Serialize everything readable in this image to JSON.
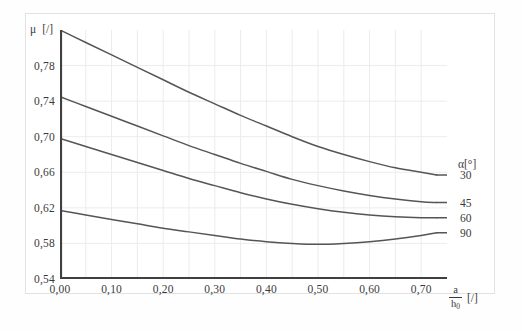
{
  "chart_data": {
    "type": "line",
    "title": "",
    "xlabel": "a/h0 [/]",
    "ylabel": "μ [/]",
    "xlim": [
      0.0,
      0.75
    ],
    "ylim": [
      0.54,
      0.82
    ],
    "grid": true,
    "legend_position": "right",
    "legend_title": "α[°]",
    "x_ticks": [
      0.0,
      0.1,
      0.2,
      0.3,
      0.4,
      0.5,
      0.6,
      0.7
    ],
    "x_tick_labels": [
      "0,00",
      "0,10",
      "0,20",
      "0,30",
      "0,40",
      "0,50",
      "0,60",
      "0,70"
    ],
    "y_ticks": [
      0.54,
      0.58,
      0.62,
      0.66,
      0.7,
      0.74,
      0.78
    ],
    "y_tick_labels": [
      "0,54",
      "0,58",
      "0,62",
      "0,66",
      "0,70",
      "0,74",
      "0,78"
    ],
    "x": [
      0.0,
      0.05,
      0.1,
      0.15,
      0.2,
      0.25,
      0.3,
      0.35,
      0.4,
      0.45,
      0.5,
      0.55,
      0.6,
      0.65,
      0.7,
      0.73
    ],
    "series": [
      {
        "name": "30",
        "label": "30",
        "color": "#555555",
        "values": [
          0.82,
          0.806,
          0.792,
          0.778,
          0.764,
          0.75,
          0.737,
          0.724,
          0.712,
          0.7,
          0.689,
          0.68,
          0.672,
          0.665,
          0.66,
          0.657
        ]
      },
      {
        "name": "45",
        "label": "45",
        "color": "#555555",
        "values": [
          0.745,
          0.734,
          0.723,
          0.712,
          0.701,
          0.69,
          0.68,
          0.67,
          0.661,
          0.652,
          0.645,
          0.639,
          0.634,
          0.63,
          0.627,
          0.626
        ]
      },
      {
        "name": "60",
        "label": "60",
        "color": "#555555",
        "values": [
          0.698,
          0.689,
          0.68,
          0.671,
          0.662,
          0.653,
          0.645,
          0.637,
          0.63,
          0.624,
          0.619,
          0.615,
          0.612,
          0.61,
          0.609,
          0.609
        ]
      },
      {
        "name": "90",
        "label": "90",
        "color": "#555555",
        "values": [
          0.617,
          0.612,
          0.607,
          0.602,
          0.597,
          0.593,
          0.589,
          0.585,
          0.582,
          0.58,
          0.579,
          0.58,
          0.582,
          0.585,
          0.589,
          0.592
        ]
      }
    ]
  },
  "axes": {
    "y_title_symbol": "μ",
    "y_title_unit": "[/]",
    "x_title_numerator": "a",
    "x_title_denominator": "h",
    "x_title_denominator_sub": "0",
    "x_title_unit": "[/]"
  },
  "colors": {
    "curve": "#555555",
    "axis": "#404040",
    "grid": "#ececec",
    "frame": "#e2e2e2",
    "text": "#3a3a3a",
    "background": "#ffffff"
  }
}
